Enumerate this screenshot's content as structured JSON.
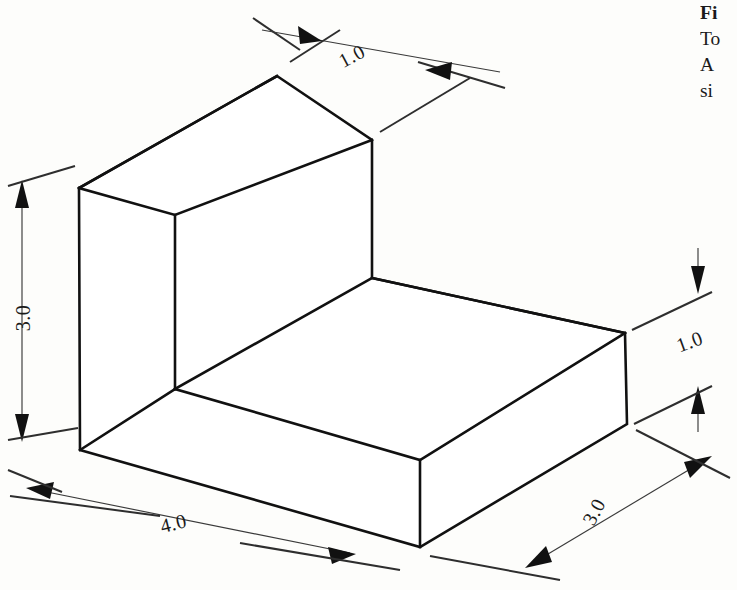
{
  "figure": {
    "type": "isometric-technical-drawing",
    "background_color": "#fdfdfb",
    "line_color": "#111111"
  },
  "dimensions": [
    {
      "id": "top-depth",
      "label": "1.0",
      "value": 1.0,
      "axis": "depth",
      "location": "top",
      "rotation_deg": -28
    },
    {
      "id": "left-height",
      "label": "3.0",
      "value": 3.0,
      "axis": "height",
      "location": "left",
      "rotation_deg": -90
    },
    {
      "id": "bottom-left-width",
      "label": "4.0",
      "value": 4.0,
      "axis": "width",
      "location": "bottom-left",
      "rotation_deg": -14
    },
    {
      "id": "bottom-right-depth",
      "label": "3.0",
      "value": 3.0,
      "axis": "depth",
      "location": "bottom-right",
      "rotation_deg": -62
    },
    {
      "id": "right-height",
      "label": "1.0",
      "value": 1.0,
      "axis": "height",
      "location": "right",
      "rotation_deg": -20
    }
  ],
  "caption": {
    "clipped": true,
    "lines": [
      {
        "text": "Fi",
        "bold": true
      },
      {
        "text": "To",
        "bold": false
      },
      {
        "text": "A",
        "bold": false
      },
      {
        "text": "si",
        "bold": false
      }
    ]
  }
}
